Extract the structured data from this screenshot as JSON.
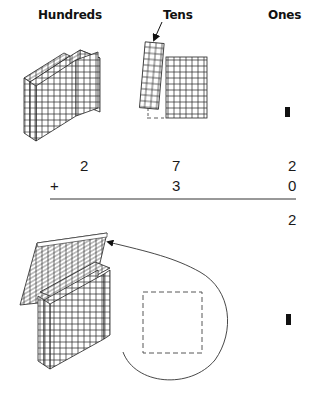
{
  "columns": {
    "hundreds": "Hundreds",
    "tens": "Tens",
    "ones": "Ones"
  },
  "problem": {
    "addend1": {
      "hundreds": "2",
      "tens": "7",
      "ones": "2"
    },
    "operator": "+",
    "addend2": {
      "tens": "3",
      "ones": "0"
    },
    "partial_sum": {
      "ones": "2"
    }
  },
  "blocks_top": {
    "hundreds_flats": 2,
    "tens_rods": 7,
    "ones_units": 2
  },
  "blocks_bottom": {
    "hundreds_flats": 3,
    "tens_rods_regrouped": 10,
    "ones_units": 2
  },
  "colors": {
    "ink": "#1a1a1a",
    "line": "#333333",
    "background": "#ffffff"
  }
}
